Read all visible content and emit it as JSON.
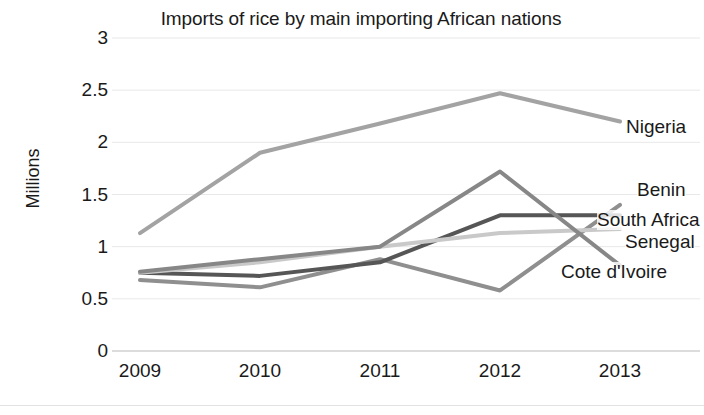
{
  "chart_data": {
    "type": "line",
    "title": "Imports of rice by main importing African nations",
    "xlabel": "",
    "ylabel": "Millions",
    "categories": [
      "2009",
      "2010",
      "2011",
      "2012",
      "2013"
    ],
    "x": [
      2009,
      2010,
      2011,
      2012,
      2013
    ],
    "ylim": [
      0,
      3
    ],
    "ytick_labels": [
      "0",
      "0.5",
      "1",
      "1.5",
      "2",
      "2.5",
      "3"
    ],
    "ytick_values": [
      0,
      0.5,
      1,
      1.5,
      2,
      2.5,
      3
    ],
    "grid": true,
    "legend_position": "right-inline-labels",
    "series": [
      {
        "name": "Nigeria",
        "color": "#a3a3a3",
        "values": [
          1.13,
          1.9,
          2.18,
          2.47,
          2.2
        ]
      },
      {
        "name": "Benin",
        "color": "#8f8f8f",
        "values": [
          0.68,
          0.61,
          0.88,
          0.58,
          1.4
        ]
      },
      {
        "name": "South Africa",
        "color": "#565656",
        "values": [
          0.75,
          0.72,
          0.85,
          1.3,
          1.3
        ]
      },
      {
        "name": "Senegal",
        "color": "#c9c9c9",
        "values": [
          0.75,
          0.85,
          1.0,
          1.13,
          1.17
        ]
      },
      {
        "name": "Cote d'Ivoire",
        "color": "#878787",
        "values": [
          0.76,
          0.88,
          1.0,
          1.72,
          0.82
        ]
      }
    ]
  },
  "axis": {
    "y_title": "Millions",
    "y_ticks": [
      "3",
      "2.5",
      "2",
      "1.5",
      "1",
      "0.5",
      "0"
    ],
    "x_ticks": [
      "2009",
      "2010",
      "2011",
      "2012",
      "2013"
    ]
  },
  "labels": {
    "nigeria": "Nigeria",
    "benin": "Benin",
    "south_africa": "South Africa",
    "senegal": "Senegal",
    "cote_divoire": "Cote d'Ivoire"
  },
  "colors": {
    "grid": "#e8e8e8",
    "text": "#1a1a1a",
    "background": "#ffffff"
  }
}
